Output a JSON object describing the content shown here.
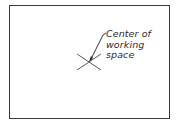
{
  "diagram": {
    "annotation": {
      "lines": [
        "Center of",
        "working",
        "space"
      ]
    },
    "marker": "center-cross",
    "colors": {
      "line": "#3a3a3a",
      "text": "#2a2a2a",
      "background": "#ffffff"
    }
  }
}
